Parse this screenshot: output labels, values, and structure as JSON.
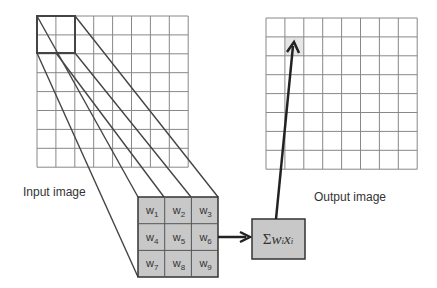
{
  "labels": {
    "input": "Input image",
    "output": "Output image"
  },
  "kernel": {
    "weights": [
      "w",
      "w",
      "w",
      "w",
      "w",
      "w",
      "w",
      "w",
      "w"
    ],
    "subscripts": [
      "1",
      "2",
      "3",
      "4",
      "5",
      "6",
      "7",
      "8",
      "9"
    ]
  },
  "sum_box": {
    "sigma": "Σ",
    "w": "w",
    "i1": "i",
    "x": "x",
    "i2": "i"
  },
  "grid": {
    "rows": 8,
    "cols": 8
  },
  "colors": {
    "grid": "#888888",
    "kernel_fill": "#c8c8c8",
    "highlight": "#e6e6e6",
    "line": "#333333"
  }
}
